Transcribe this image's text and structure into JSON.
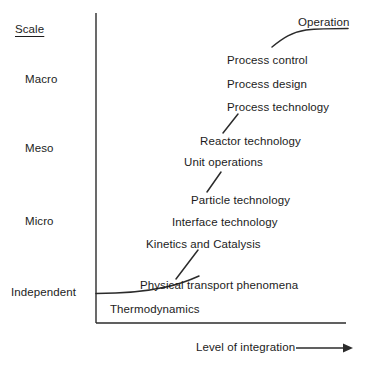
{
  "figure": {
    "type": "diagram",
    "background_color": "#ffffff",
    "line_color": "#2b2b2b",
    "text_color": "#1c1c1c"
  },
  "y_axis": {
    "heading": "Scale",
    "ticks": [
      {
        "label": "Macro",
        "x": 25,
        "y": 80
      },
      {
        "label": "Meso",
        "x": 25,
        "y": 149
      },
      {
        "label": "Micro",
        "x": 25,
        "y": 222
      },
      {
        "label": "Independent",
        "x": 11,
        "y": 293
      }
    ],
    "heading_pos": {
      "x": 15,
      "y": 30
    }
  },
  "x_axis": {
    "caption": "Level of integration",
    "caption_pos": {
      "x": 196,
      "y": 351
    },
    "arrow": "right-arrow"
  },
  "nodes": [
    {
      "label": "Operation",
      "x": 298,
      "y": 23
    },
    {
      "label": "Process control",
      "x": 227,
      "y": 61
    },
    {
      "label": "Process design",
      "x": 227,
      "y": 85
    },
    {
      "label": "Process technology",
      "x": 227,
      "y": 108
    },
    {
      "label": "Reactor technology",
      "x": 200,
      "y": 142
    },
    {
      "label": "Unit operations",
      "x": 184,
      "y": 163
    },
    {
      "label": "Particle technology",
      "x": 191,
      "y": 201
    },
    {
      "label": "Interface technology",
      "x": 172,
      "y": 223
    },
    {
      "label": "Kinetics and Catalysis",
      "x": 146,
      "y": 245
    },
    {
      "label": "Physical transport phenomena",
      "x": 140,
      "y": 286
    },
    {
      "label": "Thermodynamics",
      "x": 110,
      "y": 310
    }
  ],
  "connectors": [
    {
      "name": "operation-curve",
      "from": "Process control",
      "to": "Operation"
    },
    {
      "name": "process-technology-to-reactor-technology",
      "from": "Reactor technology",
      "to": "Process technology"
    },
    {
      "name": "unit-operations-to-particle-technology",
      "from": "Particle technology",
      "to": "Unit operations"
    },
    {
      "name": "physical-transport-to-kinetics",
      "from": "Physical transport phenomena",
      "to": "Kinetics and Catalysis"
    },
    {
      "name": "independent-baseline-curve",
      "from": "Independent axis",
      "to": "Physical transport phenomena"
    }
  ]
}
